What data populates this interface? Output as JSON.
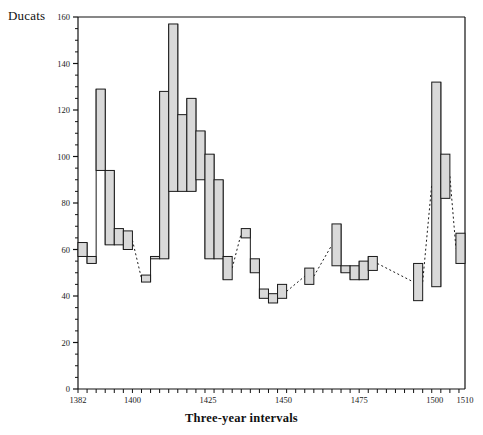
{
  "chart_data": {
    "type": "bar",
    "title": "",
    "subtitle": "",
    "xlabel": "Three-year intervals",
    "ylabel": "Ducats",
    "ylim": [
      0,
      160
    ],
    "xlim": [
      1382,
      1510
    ],
    "grid": false,
    "legend": null,
    "y_ticks": [
      0,
      20,
      40,
      60,
      80,
      100,
      120,
      140,
      160
    ],
    "y_minor_step": 5,
    "x_ticks": [
      1382,
      1400,
      1425,
      1450,
      1475,
      1500,
      1510
    ],
    "x_tick_labels": [
      "1382",
      "1400",
      "1425",
      "1450",
      "1475",
      "1500",
      "1510"
    ],
    "x_minor_step": 3,
    "bar_style": "range-bars-high-low-with-dashed-connectors",
    "bar_fill_color": "#d9d9d9",
    "bar_edge_color": "#1a1a1a",
    "connector_style": "dashed",
    "series": [
      {
        "name": "Ducats range per three-year interval",
        "intervals": [
          {
            "start": 1382,
            "end": 1385,
            "low": 57,
            "high": 63
          },
          {
            "start": 1385,
            "end": 1388,
            "low": 54,
            "high": 57
          },
          {
            "start": 1388,
            "end": 1391,
            "low": 94,
            "high": 129
          },
          {
            "start": 1391,
            "end": 1394,
            "low": 62,
            "high": 94
          },
          {
            "start": 1394,
            "end": 1397,
            "low": 62,
            "high": 69
          },
          {
            "start": 1397,
            "end": 1400,
            "low": 60,
            "high": 68
          },
          {
            "start": 1403,
            "end": 1406,
            "low": 46,
            "high": 49
          },
          {
            "start": 1406,
            "end": 1409,
            "low": 56,
            "high": 57
          },
          {
            "start": 1409,
            "end": 1412,
            "low": 56,
            "high": 128
          },
          {
            "start": 1412,
            "end": 1415,
            "low": 85,
            "high": 157
          },
          {
            "start": 1415,
            "end": 1418,
            "low": 85,
            "high": 118
          },
          {
            "start": 1418,
            "end": 1421,
            "low": 85,
            "high": 125
          },
          {
            "start": 1421,
            "end": 1424,
            "low": 90,
            "high": 111
          },
          {
            "start": 1424,
            "end": 1427,
            "low": 56,
            "high": 101
          },
          {
            "start": 1427,
            "end": 1430,
            "low": 56,
            "high": 90
          },
          {
            "start": 1430,
            "end": 1433,
            "low": 47,
            "high": 57
          },
          {
            "start": 1436,
            "end": 1439,
            "low": 65,
            "high": 69
          },
          {
            "start": 1439,
            "end": 1442,
            "low": 50,
            "high": 56
          },
          {
            "start": 1442,
            "end": 1445,
            "low": 39,
            "high": 43
          },
          {
            "start": 1445,
            "end": 1448,
            "low": 37,
            "high": 41
          },
          {
            "start": 1448,
            "end": 1451,
            "low": 39,
            "high": 45
          },
          {
            "start": 1457,
            "end": 1460,
            "low": 45,
            "high": 52
          },
          {
            "start": 1466,
            "end": 1469,
            "low": 53,
            "high": 71
          },
          {
            "start": 1469,
            "end": 1472,
            "low": 50,
            "high": 53
          },
          {
            "start": 1472,
            "end": 1475,
            "low": 47,
            "high": 53
          },
          {
            "start": 1475,
            "end": 1478,
            "low": 47,
            "high": 55
          },
          {
            "start": 1478,
            "end": 1481,
            "low": 51,
            "high": 57
          },
          {
            "start": 1493,
            "end": 1496,
            "low": 38,
            "high": 54
          },
          {
            "start": 1499,
            "end": 1502,
            "low": 44,
            "high": 132
          },
          {
            "start": 1502,
            "end": 1505,
            "low": 82,
            "high": 101
          },
          {
            "start": 1507,
            "end": 1510,
            "low": 54,
            "high": 67
          }
        ]
      }
    ]
  }
}
